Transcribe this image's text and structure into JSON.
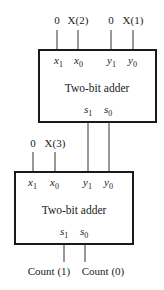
{
  "diagram": {
    "type": "cascaded two-bit adders",
    "top_adder": {
      "title": "Two-bit adder",
      "inputs": [
        {
          "signal": "0",
          "port": "x",
          "sub": "1"
        },
        {
          "signal": "X(2)",
          "port": "x",
          "sub": "0"
        },
        {
          "signal": "0",
          "port": "y",
          "sub": "1"
        },
        {
          "signal": "X(1)",
          "port": "y",
          "sub": "0"
        }
      ],
      "outputs": [
        {
          "port": "s",
          "sub": "1"
        },
        {
          "port": "s",
          "sub": "0"
        }
      ]
    },
    "bottom_adder": {
      "title": "Two-bit adder",
      "inputs": [
        {
          "signal": "0",
          "port": "x",
          "sub": "1"
        },
        {
          "signal": "X(3)",
          "port": "x",
          "sub": "0"
        },
        {
          "signal": "",
          "port": "y",
          "sub": "1"
        },
        {
          "signal": "",
          "port": "y",
          "sub": "0"
        }
      ],
      "outputs": [
        {
          "port": "s",
          "sub": "1",
          "signal": "Count (1)"
        },
        {
          "port": "s",
          "sub": "0",
          "signal": "Count (0)"
        }
      ]
    },
    "connections": [
      {
        "from": "top_adder.s1",
        "to": "bottom_adder.y1"
      },
      {
        "from": "top_adder.s0",
        "to": "bottom_adder.y0"
      }
    ]
  }
}
